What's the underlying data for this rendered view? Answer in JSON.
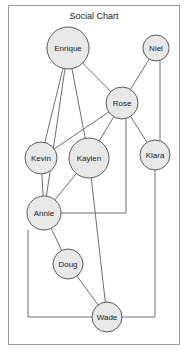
{
  "chart_data": {
    "type": "diagram",
    "diagram_kind": "node-link-graph",
    "title": "Social Chart",
    "canvas": {
      "width": 188,
      "height": 350
    },
    "frame": {
      "x": 8,
      "y": 5,
      "width": 172,
      "height": 340
    },
    "style": {
      "node_fill": "#e8e8e8",
      "node_stroke": "#5a5a5a",
      "edge_stroke": "#6f6f6f",
      "frame_stroke": "#9a9a9a",
      "background": "#ffffff",
      "label_color": "#1a1a1a"
    },
    "nodes": [
      {
        "id": "enrique",
        "label": "Enrique",
        "x": 68,
        "y": 48,
        "r": 21
      },
      {
        "id": "niel",
        "label": "Niel",
        "x": 156,
        "y": 48,
        "r": 13
      },
      {
        "id": "rose",
        "label": "Rose",
        "x": 122,
        "y": 103,
        "r": 16
      },
      {
        "id": "kevin",
        "label": "Kevin",
        "x": 41,
        "y": 158,
        "r": 16
      },
      {
        "id": "kaylen",
        "label": "Kaylen",
        "x": 89,
        "y": 158,
        "r": 20
      },
      {
        "id": "klara",
        "label": "Klara",
        "x": 155,
        "y": 155,
        "r": 15
      },
      {
        "id": "annie",
        "label": "Annie",
        "x": 44,
        "y": 213,
        "r": 17
      },
      {
        "id": "doug",
        "label": "Doug",
        "x": 68,
        "y": 264,
        "r": 15
      },
      {
        "id": "wade",
        "label": "Wade",
        "x": 107,
        "y": 317,
        "r": 15
      }
    ],
    "edges": [
      {
        "id": "enrique-rose",
        "source": "enrique",
        "target": "rose",
        "shape": "line",
        "points": [
          [
            68,
            48
          ],
          [
            122,
            103
          ]
        ]
      },
      {
        "id": "enrique-kevin",
        "source": "enrique",
        "target": "kevin",
        "shape": "line",
        "points": [
          [
            68,
            48
          ],
          [
            41,
            158
          ]
        ]
      },
      {
        "id": "enrique-kaylen",
        "source": "enrique",
        "target": "kaylen",
        "shape": "line",
        "points": [
          [
            68,
            48
          ],
          [
            89,
            158
          ]
        ]
      },
      {
        "id": "enrique-annie",
        "source": "enrique",
        "target": "annie",
        "shape": "line",
        "points": [
          [
            68,
            48
          ],
          [
            44,
            213
          ]
        ]
      },
      {
        "id": "niel-rose",
        "source": "niel",
        "target": "rose",
        "shape": "line",
        "points": [
          [
            156,
            48
          ],
          [
            122,
            103
          ]
        ]
      },
      {
        "id": "niel-klara",
        "source": "niel",
        "target": "klara",
        "shape": "orthogonal",
        "points": [
          [
            160,
            48
          ],
          [
            160,
            155
          ]
        ]
      },
      {
        "id": "rose-kevin",
        "source": "rose",
        "target": "kevin",
        "shape": "line",
        "points": [
          [
            122,
            103
          ],
          [
            41,
            158
          ]
        ]
      },
      {
        "id": "rose-kaylen",
        "source": "rose",
        "target": "kaylen",
        "shape": "line",
        "points": [
          [
            122,
            103
          ],
          [
            89,
            158
          ]
        ]
      },
      {
        "id": "rose-klara",
        "source": "rose",
        "target": "klara",
        "shape": "line",
        "points": [
          [
            122,
            103
          ],
          [
            155,
            155
          ]
        ]
      },
      {
        "id": "rose-annie",
        "source": "rose",
        "target": "annie",
        "shape": "orthogonal",
        "points": [
          [
            126,
            103
          ],
          [
            126,
            213
          ],
          [
            44,
            213
          ]
        ]
      },
      {
        "id": "kevin-annie",
        "source": "kevin",
        "target": "annie",
        "shape": "line",
        "points": [
          [
            41,
            158
          ],
          [
            44,
            213
          ]
        ]
      },
      {
        "id": "kaylen-annie",
        "source": "kaylen",
        "target": "annie",
        "shape": "line",
        "points": [
          [
            89,
            158
          ],
          [
            44,
            213
          ]
        ]
      },
      {
        "id": "kaylen-wade",
        "source": "kaylen",
        "target": "wade",
        "shape": "line",
        "points": [
          [
            89,
            158
          ],
          [
            107,
            317
          ]
        ]
      },
      {
        "id": "klara-wade",
        "source": "klara",
        "target": "wade",
        "shape": "orthogonal",
        "points": [
          [
            155,
            155
          ],
          [
            155,
            317
          ],
          [
            107,
            317
          ]
        ]
      },
      {
        "id": "annie-doug",
        "source": "annie",
        "target": "doug",
        "shape": "line",
        "points": [
          [
            44,
            213
          ],
          [
            68,
            264
          ]
        ]
      },
      {
        "id": "annie-wade",
        "source": "annie",
        "target": "wade",
        "shape": "orthogonal",
        "points": [
          [
            28,
            213
          ],
          [
            28,
            317
          ],
          [
            107,
            317
          ]
        ]
      },
      {
        "id": "doug-wade",
        "source": "doug",
        "target": "wade",
        "shape": "line",
        "points": [
          [
            68,
            264
          ],
          [
            107,
            317
          ]
        ]
      }
    ]
  },
  "chart": {
    "title": "Social Chart",
    "node_labels": {
      "enrique": "Enrique",
      "niel": "Niel",
      "rose": "Rose",
      "kevin": "Kevin",
      "kaylen": "Kaylen",
      "klara": "Klara",
      "annie": "Annie",
      "doug": "Doug",
      "wade": "Wade"
    }
  }
}
